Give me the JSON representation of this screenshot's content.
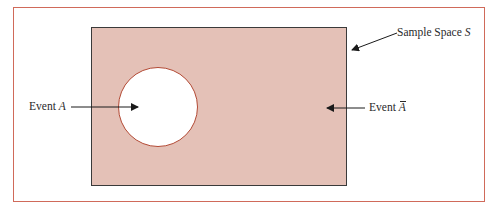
{
  "diagram": {
    "type": "venn-complement",
    "title": "",
    "colors": {
      "frame_border": "#d06a5a",
      "sample_space_fill": "#e4c1b7",
      "sample_space_border": "#3a3a3a",
      "event_fill": "#ffffff",
      "event_border": "#b34a35",
      "text": "#2a2a2a"
    },
    "labels": {
      "sample_space": {
        "prefix": "Sample Space ",
        "symbol": "S"
      },
      "event_a": {
        "prefix": "Event ",
        "symbol": "A"
      },
      "event_a_complement": {
        "prefix": "Event ",
        "symbol": "A"
      }
    }
  }
}
